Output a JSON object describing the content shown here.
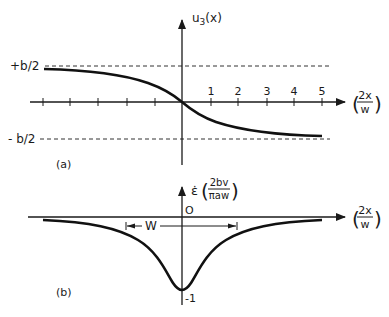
{
  "figure": {
    "panel_a": {
      "label": "(a)",
      "y_axis_label_main": "u",
      "y_axis_label_sub": "3",
      "y_axis_label_arg": "(x)",
      "x_axis_label_num": "2x",
      "x_axis_label_den": "w",
      "upper_asymptote_label": "+b/2",
      "lower_asymptote_label": "- b/2",
      "tick_labels": [
        "1",
        "2",
        "3",
        "4",
        "5"
      ],
      "curve": "u3(x) decreasing from +b/2 to -b/2, passing through origin (arctan-like)"
    },
    "panel_b": {
      "label": "(b)",
      "y_axis_label_main": "ε̇",
      "y_axis_label_num": "2bv",
      "y_axis_label_den": "πaw",
      "x_axis_label_num": "2x",
      "x_axis_label_den": "w",
      "origin_label": "O",
      "min_label": "-1",
      "width_label": "W",
      "curve": "Lorentzian-shaped dip with minimum -1 at x=0, approaching 0 at large |x|"
    }
  },
  "colors": {
    "ink": "#1a1a1a",
    "background": "#ffffff"
  }
}
